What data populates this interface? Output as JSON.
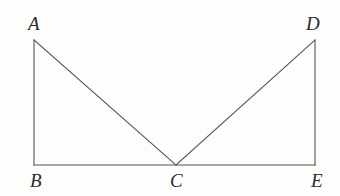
{
  "figure": {
    "background_color": "#fdfdfb",
    "stroke_color": "#555555",
    "label_color": "#2b2b2b",
    "stroke_width": 1.1,
    "width": 340,
    "height": 196,
    "points": {
      "A": {
        "label": "A",
        "x": 34,
        "y": 40
      },
      "B": {
        "label": "B",
        "x": 34,
        "y": 165
      },
      "C": {
        "label": "C",
        "x": 176,
        "y": 165
      },
      "D": {
        "label": "D",
        "x": 315,
        "y": 40
      },
      "E": {
        "label": "E",
        "x": 315,
        "y": 165
      }
    },
    "labels": [
      {
        "text": "A",
        "x": 28,
        "y": 14
      },
      {
        "text": "D",
        "x": 306,
        "y": 14
      },
      {
        "text": "B",
        "x": 30,
        "y": 171
      },
      {
        "text": "C",
        "x": 170,
        "y": 171
      },
      {
        "text": "E",
        "x": 311,
        "y": 171
      }
    ],
    "segments": [
      {
        "name": "segment-AB",
        "from": "A",
        "to": "B",
        "x1": 34,
        "y1": 40,
        "x2": 34,
        "y2": 165
      },
      {
        "name": "segment-BE",
        "from": "B",
        "to": "E",
        "x1": 34,
        "y1": 165,
        "x2": 315,
        "y2": 165
      },
      {
        "name": "segment-AC",
        "from": "A",
        "to": "C",
        "x1": 34,
        "y1": 40,
        "x2": 176,
        "y2": 165
      },
      {
        "name": "segment-CD",
        "from": "C",
        "to": "D",
        "x1": 176,
        "y1": 165,
        "x2": 315,
        "y2": 40
      },
      {
        "name": "segment-DE",
        "from": "D",
        "to": "E",
        "x1": 315,
        "y1": 40,
        "x2": 315,
        "y2": 165
      }
    ]
  }
}
